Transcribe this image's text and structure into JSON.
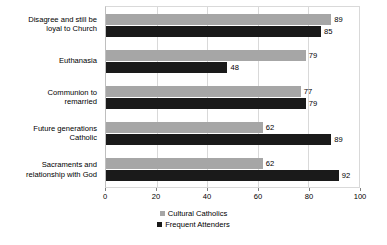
{
  "chart_data": {
    "type": "bar",
    "orientation": "horizontal",
    "title": "",
    "subtitle": "",
    "xlabel": "",
    "ylabel": "",
    "xlim": [
      0,
      100
    ],
    "xticks": [
      0,
      20,
      40,
      60,
      80,
      100
    ],
    "xtick_labels": [
      "0",
      "20",
      "40",
      "60",
      "80",
      "100"
    ],
    "grid": true,
    "grid_axis": "x",
    "legend_position": "bottom-center",
    "categories": [
      "Disagree and still be loyal to Church",
      "Euthanasia",
      "Communion to remarried",
      "Future generations Catholic",
      "Sacraments and relationship with God"
    ],
    "category_lines": [
      [
        "Disagree and still be",
        "loyal to Church"
      ],
      [
        "Euthanasia"
      ],
      [
        "Communion to",
        "remarried"
      ],
      [
        "Future generations",
        "Catholic"
      ],
      [
        "Sacraments and",
        "relationship with God"
      ]
    ],
    "series": [
      {
        "name": "Cultural Catholics",
        "color": "#a6a6a6",
        "values": [
          89,
          79,
          77,
          62,
          62
        ],
        "value_labels": [
          "89",
          "79",
          "77",
          "62",
          "62"
        ]
      },
      {
        "name": "Frequent Attenders",
        "color": "#1a1a1a",
        "values": [
          85,
          48,
          79,
          89,
          92
        ],
        "value_labels": [
          "85",
          "48",
          "79",
          "89",
          "92"
        ]
      }
    ]
  },
  "legend": {
    "items": [
      {
        "label": "Cultural Catholics",
        "series": "a"
      },
      {
        "label": "Frequent Attenders",
        "series": "b"
      }
    ]
  }
}
